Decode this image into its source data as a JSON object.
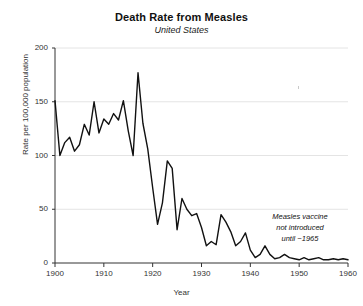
{
  "chart_data": {
    "type": "line",
    "title": "Death Rate from Measles",
    "subtitle": "United States",
    "xlabel": "Year",
    "ylabel": "Rate per 100,000 population",
    "xlim": [
      1900,
      1960
    ],
    "ylim": [
      0,
      200
    ],
    "grid": true,
    "legend": "none",
    "xticks": [
      1900,
      1910,
      1920,
      1930,
      1940,
      1950,
      1960
    ],
    "yticks": [
      0,
      50,
      100,
      150,
      200
    ],
    "annotations": [
      {
        "name": "vaccine-note",
        "lines": [
          "Measles vaccine",
          "not introduced",
          "until ~1965"
        ],
        "x": 1952,
        "y": 42
      }
    ],
    "series": [
      {
        "name": "Measles death rate",
        "color": "#111111",
        "x": [
          1900,
          1901,
          1902,
          1903,
          1904,
          1905,
          1906,
          1907,
          1908,
          1909,
          1910,
          1911,
          1912,
          1913,
          1914,
          1915,
          1916,
          1917,
          1918,
          1919,
          1920,
          1921,
          1922,
          1923,
          1924,
          1925,
          1926,
          1927,
          1928,
          1929,
          1930,
          1931,
          1932,
          1933,
          1934,
          1935,
          1936,
          1937,
          1938,
          1939,
          1940,
          1941,
          1942,
          1943,
          1944,
          1945,
          1946,
          1947,
          1948,
          1949,
          1950,
          1951,
          1952,
          1953,
          1954,
          1955,
          1956,
          1957,
          1958,
          1959,
          1960
        ],
        "values": [
          151,
          100,
          112,
          117,
          104,
          110,
          129,
          119,
          150,
          121,
          134,
          129,
          139,
          133,
          151,
          123,
          100,
          177,
          130,
          106,
          70,
          36,
          56,
          95,
          88,
          31,
          60,
          50,
          44,
          46,
          33,
          16,
          20,
          17,
          45,
          38,
          29,
          16,
          20,
          28,
          12,
          5,
          8,
          16,
          8,
          4,
          5,
          8,
          5,
          4,
          3,
          5,
          3,
          4,
          5,
          3,
          3,
          4,
          3,
          4,
          3
        ]
      }
    ]
  }
}
